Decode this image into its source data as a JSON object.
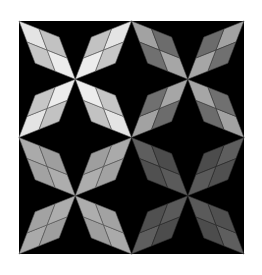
{
  "canvas": {
    "width": 262,
    "height": 275,
    "background": "#ffffff"
  },
  "board": {
    "x": 19,
    "y": 21,
    "width": 225,
    "height": 233,
    "color": "#000000",
    "seam_color": "#3a3a3a"
  },
  "petal_shape": {
    "note": "parallelogram in normalized quadrant coords: tip (0,0), side A, side B, far tip at quadrant center",
    "sideA": [
      0.357,
      0.138
    ],
    "sideB": [
      0.143,
      0.362
    ],
    "center": [
      0.5,
      0.5
    ]
  },
  "quadrants": [
    {
      "id": "top-left",
      "tone": "light",
      "tip": "#e4e4e4",
      "sideA": "#c2c2c2",
      "sideB": "#c6c6c6",
      "inner": "#ececec",
      "line": "#5a5a5a"
    },
    {
      "id": "top-right",
      "tone": "medium-dark",
      "tip": "#a2a2a2",
      "sideA": "#6c6c6c",
      "sideB": "#707070",
      "inner": "#a6a6a6",
      "line": "#3c3c3c"
    },
    {
      "id": "bottom-left",
      "tone": "medium",
      "tip": "#aaaaaa",
      "sideA": "#9e9e9e",
      "sideB": "#a2a2a2",
      "inner": "#adadad",
      "line": "#555555"
    },
    {
      "id": "bottom-right",
      "tone": "dark",
      "tip": "#5e5e5e",
      "sideA": "#4c4c4c",
      "sideB": "#505050",
      "inner": "#5a5a5a",
      "line": "#2a2a2a"
    }
  ]
}
